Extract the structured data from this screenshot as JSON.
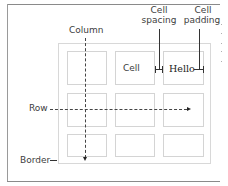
{
  "diagram": {
    "labels": {
      "column": "Column",
      "row": "Row",
      "border": "Border",
      "cell_spacing_line1": "Cell",
      "cell_spacing_line2": "spacing",
      "cell_padding_line1": "Cell",
      "cell_padding_line2": "padding",
      "border_dash": "—"
    },
    "cells": {
      "r1c2": "Cell",
      "r1c3": "Hello"
    },
    "grid": {
      "rows": 3,
      "columns": 3
    },
    "colors": {
      "frame": "#8a8a8a",
      "table_border": "#d8d8d8",
      "cell_border": "#d4d4d4",
      "text": "#404040",
      "arrows": "#333333"
    }
  }
}
